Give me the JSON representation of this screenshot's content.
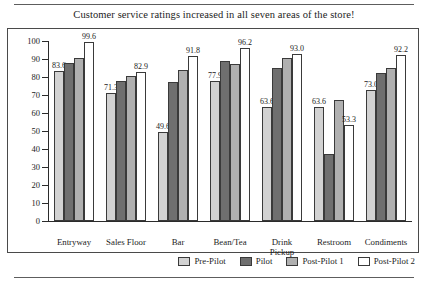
{
  "chart_data": {
    "type": "bar",
    "title": "Customer service ratings increased in all seven areas of the store!",
    "xlabel": "",
    "ylabel": "",
    "ylim": [
      0,
      100
    ],
    "yticks": [
      0,
      10,
      20,
      30,
      40,
      50,
      60,
      70,
      80,
      90,
      100
    ],
    "grid": false,
    "legend_position": "bottom-right",
    "categories": [
      "Entryway",
      "Sales Floor",
      "Bar",
      "Bean/Tea",
      "Drink\nPickup",
      "Restroom",
      "Condiments"
    ],
    "series": [
      {
        "name": "Pre-Pilot",
        "color": "#d2d2d2",
        "values": [
          83.6,
          71.3,
          49.6,
          77.9,
          63.6,
          63.6,
          73.0
        ],
        "labels": [
          "83.6",
          "71.3",
          "49.6",
          "77.9",
          "63.6",
          "63.6",
          "73.0"
        ]
      },
      {
        "name": "Pilot",
        "color": "#6f6f6f",
        "values": [
          88.0,
          78.0,
          77.0,
          89.0,
          85.0,
          37.0,
          82.0
        ],
        "labels": [
          "",
          "",
          "",
          "",
          "",
          "",
          ""
        ]
      },
      {
        "name": "Post-Pilot 1",
        "color": "#b0b0b0",
        "values": [
          90.5,
          80.5,
          84.0,
          87.0,
          90.5,
          67.0,
          85.0
        ],
        "labels": [
          "",
          "",
          "",
          "",
          "",
          "",
          ""
        ]
      },
      {
        "name": "Post-Pilot 2",
        "color": "#ffffff",
        "values": [
          99.6,
          82.9,
          91.8,
          96.2,
          93.0,
          53.3,
          92.2
        ],
        "labels": [
          "99.6",
          "82.9",
          "91.8",
          "96.2",
          "93.0",
          "53.3",
          "92.2"
        ]
      }
    ]
  }
}
